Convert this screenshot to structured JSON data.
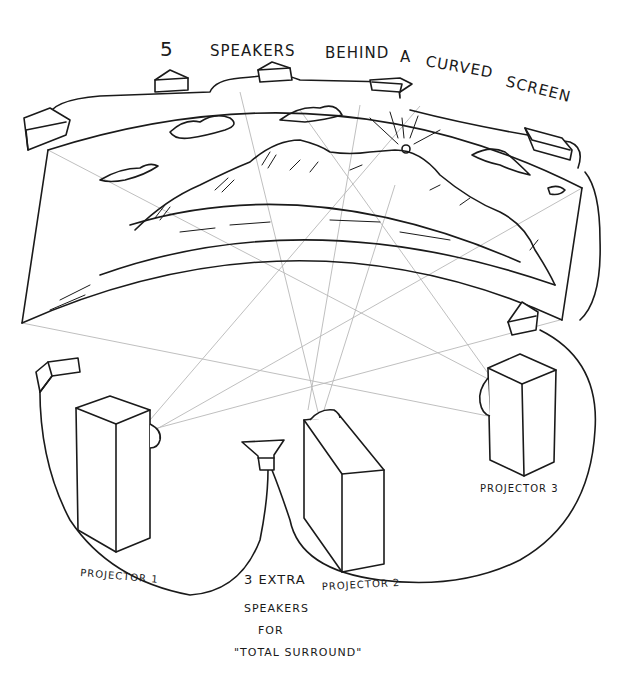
{
  "title": {
    "line": [
      "5",
      "SPEAKERS",
      "BEHIND",
      "A",
      "CURVED",
      "SCREEN"
    ]
  },
  "labels": {
    "projector1": "PROJECTOR 1",
    "projector2": "PROJECTOR 2",
    "projector3": "PROJECTOR 3",
    "extra_speakers": [
      "3 EXTRA",
      "SPEAKERS",
      "FOR",
      "\"TOTAL SURROUND\""
    ]
  },
  "colors": {
    "ink": "#1a1a1a",
    "projection_rays": "#b8b8b8",
    "background": "#ffffff"
  },
  "elements": {
    "screen_speakers_count": 5,
    "extra_speakers_count": 3,
    "projectors_count": 3
  }
}
